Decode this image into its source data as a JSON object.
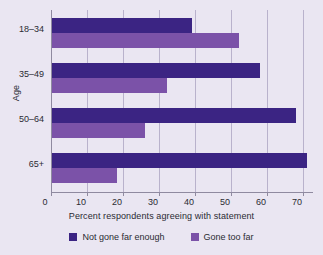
{
  "chart_data": {
    "type": "bar",
    "orientation": "horizontal",
    "title": "",
    "xlabel": "Percent respondents agreeing with statement",
    "ylabel": "Age",
    "categories": [
      "18–34",
      "35–49",
      "50–64",
      "65+"
    ],
    "series": [
      {
        "name": "Not gone far enough",
        "color": "#3B2483",
        "values": [
          39,
          58,
          68,
          71
        ]
      },
      {
        "name": "Gone too far",
        "color": "#7B52A8",
        "values": [
          52,
          32,
          26,
          18
        ]
      }
    ],
    "xlim": [
      0,
      73
    ],
    "xticks": [
      0,
      10,
      20,
      30,
      40,
      50,
      60,
      70
    ],
    "xtick_labels": [
      "0",
      "10",
      "20",
      "30",
      "40",
      "50",
      "60",
      "70"
    ],
    "grid": true,
    "grid_axis": "x",
    "legend_position": "bottom",
    "background_color": "#EAE6F2",
    "axis_color": "#8F8AA0",
    "grid_color": "#B9B2CC",
    "text_color": "#2B2B33"
  },
  "legend": {
    "items": [
      {
        "label": "Not gone far enough",
        "color": "#3B2483"
      },
      {
        "label": "Gone too far",
        "color": "#7B52A8"
      }
    ]
  }
}
